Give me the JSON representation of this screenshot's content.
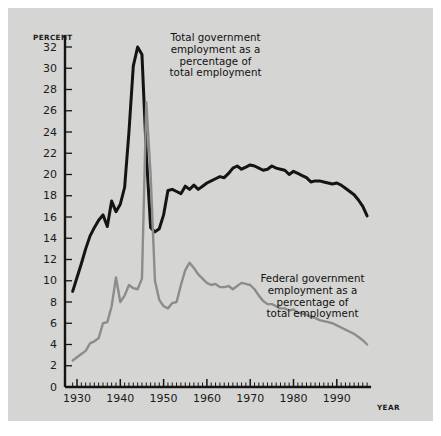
{
  "figure": {
    "background_color": "#d5d5d3",
    "page_color": "#ffffff"
  },
  "axes": {
    "y_axis_title": "PERCENT",
    "x_axis_title": "YEAR",
    "y_ticks": [
      "0",
      "2",
      "4",
      "6",
      "8",
      "10",
      "12",
      "14",
      "16",
      "18",
      "20",
      "22",
      "24",
      "26",
      "28",
      "30",
      "32"
    ],
    "x_ticks": [
      "1930",
      "1940",
      "1950",
      "1960",
      "1970",
      "1980",
      "1990"
    ]
  },
  "annotations": {
    "total": "Total government\nemployment as a\npercentage of\ntotal employment",
    "federal": "Federal government\nemployment as a\npercentage of\ntotal employment"
  },
  "chart_data": {
    "type": "line",
    "title": "Government employment as a percentage of total employment",
    "xlabel": "YEAR",
    "ylabel": "PERCENT",
    "xlim": [
      1929,
      1997
    ],
    "ylim": [
      0,
      33
    ],
    "grid": false,
    "legend": "annotations-inline",
    "x": [
      1929,
      1930,
      1931,
      1932,
      1933,
      1934,
      1935,
      1936,
      1937,
      1938,
      1939,
      1940,
      1941,
      1942,
      1943,
      1944,
      1945,
      1946,
      1947,
      1948,
      1949,
      1950,
      1951,
      1952,
      1953,
      1954,
      1955,
      1956,
      1957,
      1958,
      1959,
      1960,
      1961,
      1962,
      1963,
      1964,
      1965,
      1966,
      1967,
      1968,
      1969,
      1970,
      1971,
      1972,
      1973,
      1974,
      1975,
      1976,
      1977,
      1978,
      1979,
      1980,
      1981,
      1982,
      1983,
      1984,
      1985,
      1986,
      1987,
      1988,
      1989,
      1990,
      1991,
      1992,
      1993,
      1994,
      1995,
      1996,
      1997
    ],
    "series": [
      {
        "name": "Total government employment as a percentage of total employment",
        "color": "#141414",
        "values": [
          9.0,
          10.3,
          11.6,
          13.0,
          14.2,
          15.0,
          15.7,
          16.2,
          15.1,
          17.5,
          16.5,
          17.2,
          18.8,
          24.0,
          30.2,
          32.0,
          31.3,
          22.0,
          15.0,
          14.6,
          14.9,
          16.2,
          18.5,
          18.6,
          18.4,
          18.2,
          18.9,
          18.6,
          19.0,
          18.6,
          18.9,
          19.2,
          19.4,
          19.6,
          19.8,
          19.7,
          20.1,
          20.6,
          20.8,
          20.5,
          20.7,
          20.9,
          20.8,
          20.6,
          20.4,
          20.5,
          20.8,
          20.6,
          20.5,
          20.4,
          20.0,
          20.3,
          20.1,
          19.9,
          19.7,
          19.3,
          19.4,
          19.4,
          19.3,
          19.2,
          19.1,
          19.2,
          19.0,
          18.7,
          18.4,
          18.1,
          17.6,
          17.0,
          16.1
        ]
      },
      {
        "name": "Federal government employment as a percentage of total employment",
        "color": "#8c8c8c",
        "values": [
          2.5,
          2.8,
          3.1,
          3.4,
          4.1,
          4.3,
          4.6,
          6.0,
          6.1,
          7.6,
          10.3,
          8.0,
          8.6,
          9.6,
          9.3,
          9.2,
          10.2,
          26.8,
          20.0,
          10.0,
          8.2,
          7.6,
          7.4,
          7.9,
          8.0,
          9.6,
          11.0,
          11.7,
          11.2,
          10.6,
          10.2,
          9.8,
          9.6,
          9.7,
          9.4,
          9.4,
          9.5,
          9.2,
          9.5,
          9.8,
          9.7,
          9.6,
          9.2,
          8.6,
          8.1,
          7.8,
          7.8,
          7.6,
          7.4,
          7.4,
          7.2,
          7.3,
          7.0,
          6.9,
          6.8,
          6.6,
          6.5,
          6.3,
          6.2,
          6.1,
          6.0,
          5.8,
          5.6,
          5.4,
          5.2,
          5.0,
          4.7,
          4.4,
          4.0
        ]
      }
    ]
  }
}
